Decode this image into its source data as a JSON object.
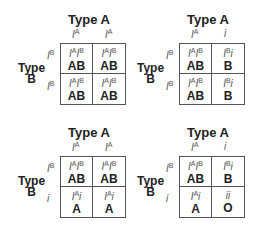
{
  "squares": [
    {
      "title": "Type A",
      "side": "Type B",
      "cols": [
        "I^A",
        "I^A"
      ],
      "rows": [
        "I^B",
        "I^B"
      ],
      "cells": [
        [
          {
            "geno": "I^A I^B",
            "pheno": "AB"
          },
          {
            "geno": "I^A I^B",
            "pheno": "AB"
          }
        ],
        [
          {
            "geno": "I^A I^B",
            "pheno": "AB"
          },
          {
            "geno": "I^A I^B",
            "pheno": "AB"
          }
        ]
      ]
    },
    {
      "title": "Type A",
      "side": "Type B",
      "cols": [
        "I^A",
        "i"
      ],
      "rows": [
        "I^B",
        "I^B"
      ],
      "cells": [
        [
          {
            "geno": "I^A I^B",
            "pheno": "AB"
          },
          {
            "geno": "I^B i",
            "pheno": "B"
          }
        ],
        [
          {
            "geno": "I^A I^B",
            "pheno": "AB"
          },
          {
            "geno": "I^B i",
            "pheno": "B"
          }
        ]
      ]
    },
    {
      "title": "Type A",
      "side": "Type B",
      "cols": [
        "I^A",
        "I^A"
      ],
      "rows": [
        "I^B",
        "i"
      ],
      "cells": [
        [
          {
            "geno": "I^A I^B",
            "pheno": "AB"
          },
          {
            "geno": "I^A I^B",
            "pheno": "AB"
          }
        ],
        [
          {
            "geno": "I^A i",
            "pheno": "A"
          },
          {
            "geno": "I^A i",
            "pheno": "A"
          }
        ]
      ]
    },
    {
      "title": "Type A",
      "side": "Type B",
      "cols": [
        "I^A",
        "i"
      ],
      "rows": [
        "I^B",
        "i"
      ],
      "cells": [
        [
          {
            "geno": "I^A I^B",
            "pheno": "AB"
          },
          {
            "geno": "I^B i",
            "pheno": "B"
          }
        ],
        [
          {
            "geno": "I^A i",
            "pheno": "A"
          },
          {
            "geno": "ii",
            "pheno": "O"
          }
        ]
      ]
    }
  ]
}
